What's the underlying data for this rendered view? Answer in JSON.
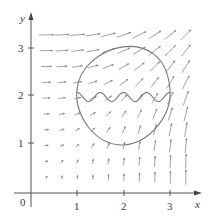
{
  "figure": {
    "type": "vector-field-with-curve",
    "x_axis": {
      "label": "x",
      "range": [
        0,
        3.5
      ],
      "ticks": [
        {
          "value": 1,
          "label": "1"
        },
        {
          "value": 2,
          "label": "2"
        },
        {
          "value": 3,
          "label": "3"
        }
      ]
    },
    "y_axis": {
      "label": "y",
      "range": [
        0,
        3.5
      ],
      "ticks": [
        {
          "value": 1,
          "label": "1"
        },
        {
          "value": 2,
          "label": "2"
        },
        {
          "value": 3,
          "label": "3"
        }
      ]
    },
    "origin_label": "0",
    "vector_field": {
      "grid_spacing": 0.333,
      "x_range": [
        0.333,
        3.333
      ],
      "y_range": [
        0.333,
        3.333
      ],
      "description": "Field directed up-right; nearly horizontal near top-left, nearly vertical near bottom-right, magnitude increases away from origin"
    },
    "curve": {
      "description": "Closed region: circular arc on top from (1,2.1) to (3,2.1), pointed bottom near (2,1); wavy sinusoidal line across at y≈2 from x=1 to x=3",
      "wave_periods": 4
    },
    "colors": {
      "axis": "#555555",
      "curve": "#777777",
      "arrows": "#8a8a8a",
      "background": "#ffffff"
    }
  }
}
